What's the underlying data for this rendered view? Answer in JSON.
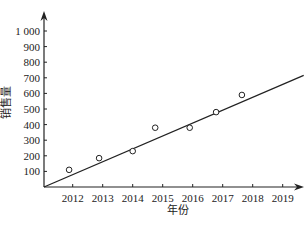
{
  "chart_data": {
    "type": "scatter",
    "title": "",
    "xlabel": "年份",
    "ylabel": "销售量",
    "x_ticks": [
      "2012",
      "2013",
      "2014",
      "2015",
      "2016",
      "2017",
      "2018",
      "2019"
    ],
    "y_ticks": [
      "100",
      "200",
      "300",
      "400",
      "500",
      "600",
      "700",
      "800",
      "900",
      "1 000"
    ],
    "ylim": [
      0,
      1000
    ],
    "xlim": [
      2011,
      2019.6
    ],
    "grid": false,
    "legend": null,
    "series": [
      {
        "name": "销售量",
        "type": "scatter",
        "marker": "hollow-circle",
        "points": [
          {
            "x": 2011.88,
            "y": 110
          },
          {
            "x": 2012.88,
            "y": 185
          },
          {
            "x": 2014.0,
            "y": 230
          },
          {
            "x": 2014.75,
            "y": 380
          },
          {
            "x": 2015.9,
            "y": 380
          },
          {
            "x": 2016.78,
            "y": 480
          },
          {
            "x": 2017.64,
            "y": 590
          }
        ]
      },
      {
        "name": "回归直线",
        "type": "line",
        "points": [
          {
            "x": 2011.0,
            "y": 0
          },
          {
            "x": 2019.7,
            "y": 716
          }
        ]
      }
    ],
    "colors": {
      "ink": "#222222",
      "background": "#ffffff"
    }
  }
}
